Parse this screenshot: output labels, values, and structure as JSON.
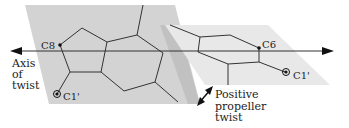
{
  "diagram": {
    "labels": {
      "c8": "C8",
      "c6": "C6",
      "c1_left": "C1'",
      "c1_right": "C1'",
      "axis_line1": "Axis",
      "axis_line2": "of",
      "axis_line3": "twist",
      "twist_line1": "Positive",
      "twist_line2": "propeller",
      "twist_line3": "twist"
    },
    "colors": {
      "plane_left": "#d2d2d2",
      "plane_right": "#e6e6e6",
      "shadow": "#bdbdbd",
      "line": "#333333",
      "arrow": "#111111"
    }
  }
}
